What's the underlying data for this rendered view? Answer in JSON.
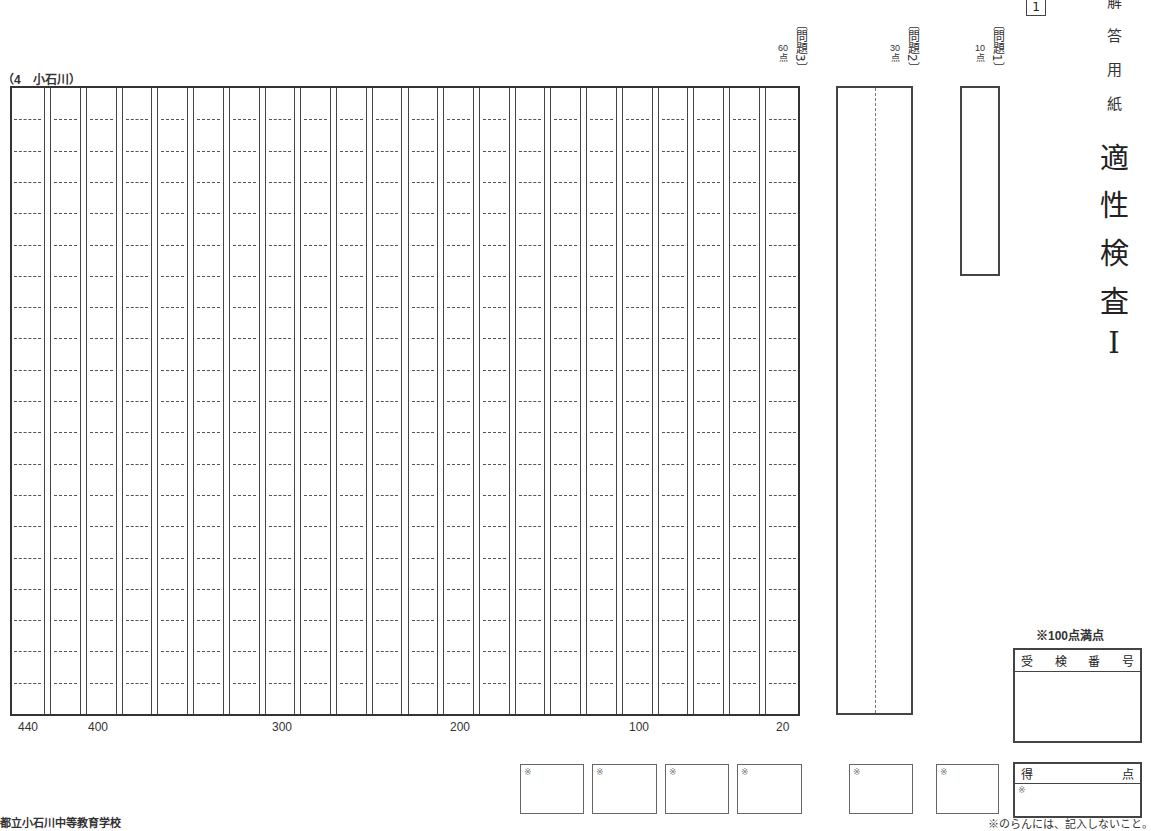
{
  "header": {
    "page_number": "1",
    "title_small": [
      "解",
      "答",
      "用",
      "紙"
    ],
    "title_big": [
      "適",
      "性",
      "検",
      "査",
      "I"
    ]
  },
  "school_label": "（4　小石川）",
  "questions": [
    {
      "id": "q3",
      "label": "〔問題3〕",
      "points": "60\n点"
    },
    {
      "id": "q2",
      "label": "〔問題2〕",
      "points": "30\n点"
    },
    {
      "id": "q1",
      "label": "〔問題1〕",
      "points": "10\n点"
    }
  ],
  "essay_grid": {
    "columns": 22,
    "rows": 20,
    "count_labels": [
      {
        "text": "440",
        "x": 18
      },
      {
        "text": "400",
        "x": 88
      },
      {
        "text": "300",
        "x": 272
      },
      {
        "text": "200",
        "x": 450
      },
      {
        "text": "100",
        "x": 629
      },
      {
        "text": "20",
        "x": 776
      }
    ]
  },
  "score_boxes": [
    {
      "mark": "※"
    },
    {
      "mark": "※"
    },
    {
      "mark": "※"
    },
    {
      "mark": "※"
    },
    {
      "mark": "※"
    },
    {
      "mark": "※"
    }
  ],
  "full_score_note": "※100点満点",
  "exam_number": {
    "header_chars": [
      "受",
      "検",
      "番",
      "号"
    ],
    "value": ""
  },
  "total_score": {
    "label_left": "得",
    "label_right": "点",
    "mark": "※",
    "value": ""
  },
  "footer_left": "都立小石川中等教育学校",
  "footer_right": "※のらんには、記入しないこと。"
}
